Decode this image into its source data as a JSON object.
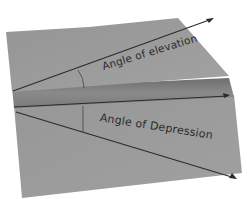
{
  "scene": {
    "description": "Photo of a folded gray paper foldable showing two triangles",
    "background_color": "#ffffff",
    "paper_color": "#9a9a9a",
    "paper_dark": "#7c7c7c",
    "line_color": "#2b2b2b"
  },
  "panels": {
    "top": {
      "label": "Angle of elevation"
    },
    "bottom": {
      "label": "Angle of Depression"
    }
  }
}
